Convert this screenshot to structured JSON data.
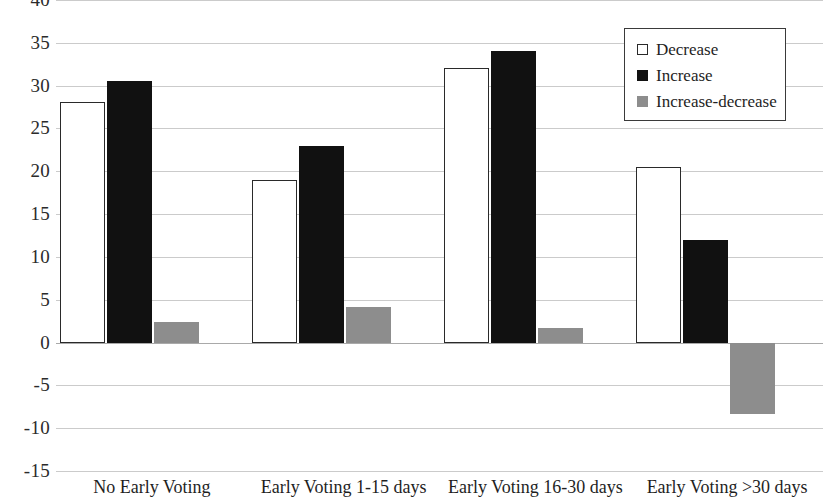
{
  "chart_data": {
    "type": "bar",
    "title": "",
    "subtitle": "",
    "xlabel": "",
    "ylabel": "",
    "ylim": [
      -15,
      40
    ],
    "ytick_step": 5,
    "grid": true,
    "legend_position": "top-right",
    "categories": [
      "No Early Voting",
      "Early Voting 1-15 days",
      "Early Voting 16-30 days",
      "Early Voting >30 days"
    ],
    "yticks": [
      "40",
      "35",
      "30",
      "25",
      "20",
      "15",
      "10",
      "5",
      "0",
      "-5",
      "-10",
      "-15"
    ],
    "ytick_values": [
      40,
      35,
      30,
      25,
      20,
      15,
      10,
      5,
      0,
      -5,
      -10,
      -15
    ],
    "series": [
      {
        "name": "Decrease",
        "color": "#ffffff",
        "edge_color": "#2a2a2a",
        "values": [
          28.1,
          19.0,
          32.1,
          20.5
        ]
      },
      {
        "name": "Increase",
        "color": "#111111",
        "edge_color": "#111111",
        "values": [
          30.5,
          23.0,
          34.0,
          12.0
        ]
      },
      {
        "name": "Increase-decrease",
        "color": "#8d8d8d",
        "edge_color": "#8d8d8d",
        "values": [
          2.4,
          4.2,
          1.7,
          -8.4
        ]
      }
    ]
  },
  "legend": {
    "entries": [
      {
        "label": "Decrease",
        "swatch": "decrease"
      },
      {
        "label": "Increase",
        "swatch": "increase"
      },
      {
        "label": "Increase-decrease",
        "swatch": "increase-decrease"
      }
    ]
  }
}
